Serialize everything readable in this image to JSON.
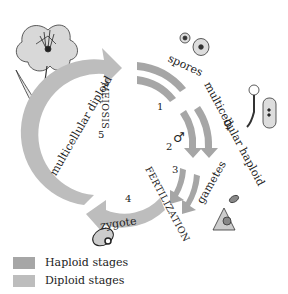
{
  "diagram": {
    "processes": {
      "meiosis": "MEIOSIS",
      "fertilization": "FERTILIZATION"
    },
    "stages": {
      "spores": "spores",
      "multicellular_haploid": "multicellular haploid",
      "gametes": "gametes",
      "zygote": "zygote",
      "multicellular_diploid": "multicellular diploid"
    },
    "step_numbers": [
      "1",
      "2",
      "3",
      "4",
      "5"
    ],
    "symbols": {
      "male": "♂",
      "female": "♀"
    },
    "colors": {
      "haploid": "#a6a6a6",
      "diploid": "#bdbdbd"
    }
  },
  "legend": {
    "items": [
      {
        "label": "Haploid stages",
        "color": "#a6a6a6"
      },
      {
        "label": "Diploid stages",
        "color": "#bdbdbd"
      }
    ]
  }
}
